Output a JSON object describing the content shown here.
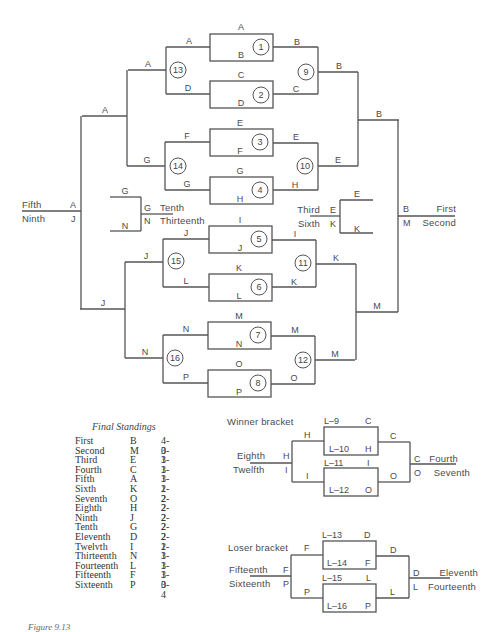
{
  "main_bracket": {
    "games": [
      {
        "id": "1",
        "top": "A",
        "bottom": "B",
        "winner": "B"
      },
      {
        "id": "2",
        "top": "C",
        "bottom": "D",
        "winner": "C"
      },
      {
        "id": "3",
        "top": "E",
        "bottom": "F",
        "winner": "E"
      },
      {
        "id": "4",
        "top": "G",
        "bottom": "H",
        "winner": "H"
      },
      {
        "id": "5",
        "top": "I",
        "bottom": "J",
        "winner": "I"
      },
      {
        "id": "6",
        "top": "K",
        "bottom": "L",
        "winner": "K"
      },
      {
        "id": "7",
        "top": "M",
        "bottom": "N",
        "winner": "M"
      },
      {
        "id": "8",
        "top": "O",
        "bottom": "P",
        "winner": "O"
      }
    ],
    "left_round2": [
      {
        "id": "13",
        "top": "A",
        "bottom": "D",
        "winner": "A"
      },
      {
        "id": "14",
        "top": "F",
        "bottom": "G",
        "winner": "G"
      },
      {
        "id": "15",
        "top": "J",
        "bottom": "L",
        "winner": "J"
      },
      {
        "id": "16",
        "top": "N",
        "bottom": "P",
        "winner": "N"
      }
    ],
    "left_round3": {
      "top_winner": "A",
      "bottom_winner": "J"
    },
    "left_final": {
      "top": "A",
      "bottom": "J",
      "top_place": "Fifth",
      "bottom_place": "Ninth"
    },
    "right_round2": [
      {
        "id": "9",
        "top": "B",
        "bottom": "C",
        "winner": "B"
      },
      {
        "id": "10",
        "top": "E",
        "bottom": "H",
        "winner": "E"
      },
      {
        "id": "11",
        "top": "I",
        "bottom": "K",
        "winner": "K"
      },
      {
        "id": "12",
        "top": "M",
        "bottom": "O",
        "winner": "M"
      }
    ],
    "right_round3": {
      "top_winner": "B",
      "bottom_winner": "M"
    },
    "right_final": {
      "top": "B",
      "bottom": "M",
      "top_place": "First",
      "bottom_place": "Second"
    },
    "tenth_game": {
      "top": "G",
      "bottom": "N",
      "top_place": "Tenth",
      "bottom_place": "Thirteenth"
    },
    "third_game": {
      "top": "E",
      "bottom": "K",
      "top_place": "Third",
      "bottom_place": "Sixth"
    }
  },
  "final_standings": {
    "title": "Final Standings",
    "rows": [
      {
        "place": "First",
        "team": "B",
        "record": "4-0"
      },
      {
        "place": "Second",
        "team": "M",
        "record": "3-1"
      },
      {
        "place": "Third",
        "team": "E",
        "record": "3-1"
      },
      {
        "place": "Fourth",
        "team": "C",
        "record": "3-1"
      },
      {
        "place": "Fifth",
        "team": "A",
        "record": "3-1"
      },
      {
        "place": "Sixth",
        "team": "K",
        "record": "2-2"
      },
      {
        "place": "Seventh",
        "team": "O",
        "record": "2-2"
      },
      {
        "place": "Eighth",
        "team": "H",
        "record": "2-2"
      },
      {
        "place": "Ninth",
        "team": "J",
        "record": "2-2"
      },
      {
        "place": "Tenth",
        "team": "G",
        "record": "2-2"
      },
      {
        "place": "Eleventh",
        "team": "D",
        "record": "2-2"
      },
      {
        "place": "Twelvth",
        "team": "I",
        "record": "1-3"
      },
      {
        "place": "Thirteenth",
        "team": "N",
        "record": "1-3"
      },
      {
        "place": "Fourteenth",
        "team": "L",
        "record": "1-3"
      },
      {
        "place": "Fifteenth",
        "team": "F",
        "record": "1-3"
      },
      {
        "place": "Sixteenth",
        "team": "P",
        "record": "0-4"
      }
    ]
  },
  "winner_bracket": {
    "title": "Winner bracket",
    "game_a": {
      "top_label": "L–9",
      "top_team": "C",
      "bottom_label": "L–10",
      "bottom_team": "H",
      "winner": "C"
    },
    "game_b": {
      "top_label": "L–11",
      "top_team": "I",
      "bottom_label": "L–12",
      "bottom_team": "O",
      "winner": "O"
    },
    "left_top": "H",
    "left_bottom": "I",
    "left_final": {
      "top": "H",
      "bottom": "I",
      "top_place": "Eighth",
      "bottom_place": "Twelfth"
    },
    "right_final": {
      "top": "C",
      "bottom": "O",
      "top_place": "Fourth",
      "bottom_place": "Seventh"
    }
  },
  "loser_bracket": {
    "title": "Loser bracket",
    "game_a": {
      "top_label": "L–13",
      "top_team": "D",
      "bottom_label": "L–14",
      "bottom_team": "F",
      "winner": "D"
    },
    "game_b": {
      "top_label": "L–15",
      "top_team": "L",
      "bottom_label": "L–16",
      "bottom_team": "P",
      "winner": "L"
    },
    "left_top": "F",
    "left_bottom": "P",
    "left_final": {
      "top": "F",
      "bottom": "P",
      "top_place": "Fifteenth",
      "bottom_place": "Sixteenth"
    },
    "right_final": {
      "top": "D",
      "bottom": "L",
      "top_place": "Eleventh",
      "bottom_place": "Fourteenth"
    }
  },
  "caption": "Figure 9.13"
}
